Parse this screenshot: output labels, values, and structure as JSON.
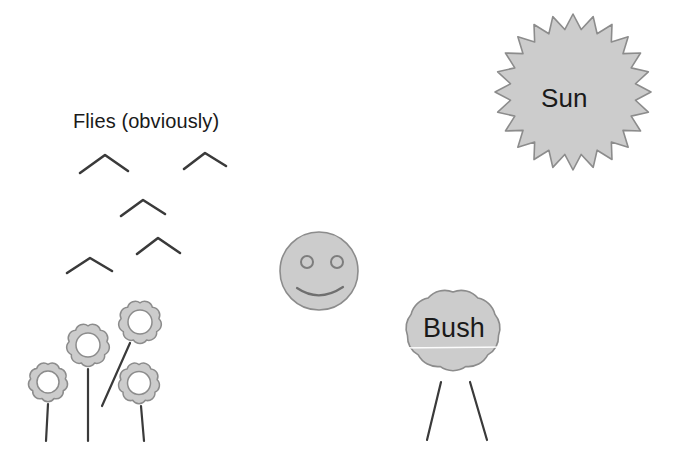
{
  "scene": {
    "title": "Hand-drawn outdoor scene",
    "width": 678,
    "height": 468,
    "background_color": "#ffffff",
    "fill_color": "#cccccc",
    "outline_color": "#808080",
    "ink_color": "#3a3a3a",
    "text_color": "#1a1a1a"
  },
  "labels": {
    "flies": "Flies (obviously)",
    "sun": "Sun",
    "bush": "Bush"
  },
  "objects": {
    "sun": {
      "name": "sun",
      "icon": "sun-starburst-icon",
      "shape": "starburst",
      "points": 24,
      "center": [
        573,
        92
      ],
      "outer_radius": 78,
      "inner_radius": 63,
      "fill": "#cccccc",
      "stroke": "#808080"
    },
    "face": {
      "name": "smiley-face",
      "icon": "smiley-face-icon",
      "shape": "circle",
      "center": [
        319,
        271
      ],
      "radius": 39,
      "fill": "#cccccc",
      "stroke": "#808080",
      "eyes": [
        {
          "center": [
            307,
            262
          ],
          "radius": 6
        },
        {
          "center": [
            337,
            262
          ],
          "radius": 6
        }
      ],
      "mouth": {
        "from": [
          297,
          288
        ],
        "control": [
          319,
          303
        ],
        "to": [
          343,
          287
        ]
      }
    },
    "bush": {
      "name": "bush",
      "icon": "bush-cloud-icon",
      "shape": "cloud",
      "center": [
        453,
        330
      ],
      "fill": "#cccccc",
      "stroke": "#808080",
      "lobes": 11,
      "stems": [
        {
          "from": [
            441,
            382
          ],
          "to": [
            427,
            440
          ]
        },
        {
          "from": [
            470,
            382
          ],
          "to": [
            487,
            440
          ]
        }
      ]
    },
    "flies": {
      "name": "flies",
      "icon": "chevron-fly-icon",
      "count": 5,
      "stroke": "#3a3a3a",
      "stroke_width": 2.6,
      "marks": [
        {
          "left": [
            80,
            173
          ],
          "apex": [
            105,
            155
          ],
          "right": [
            128,
            171
          ]
        },
        {
          "left": [
            184,
            169
          ],
          "apex": [
            205,
            153
          ],
          "right": [
            226,
            166
          ]
        },
        {
          "left": [
            121,
            216
          ],
          "apex": [
            143,
            200
          ],
          "right": [
            165,
            214
          ]
        },
        {
          "left": [
            137,
            254
          ],
          "apex": [
            158,
            238
          ],
          "right": [
            180,
            253
          ]
        },
        {
          "left": [
            67,
            273
          ],
          "apex": [
            90,
            258
          ],
          "right": [
            112,
            271
          ]
        }
      ]
    },
    "flowers": {
      "name": "flowers",
      "icon": "flower-icon",
      "count": 4,
      "fill": "#cccccc",
      "stroke": "#808080",
      "petals": 9,
      "items": [
        {
          "center": [
            48,
            382
          ],
          "outer_radius": 22,
          "inner_radius": 11,
          "stem": {
            "from": [
              48,
              404
            ],
            "to": [
              46,
              441
            ]
          }
        },
        {
          "center": [
            88,
            345
          ],
          "outer_radius": 24,
          "inner_radius": 12,
          "stem": {
            "from": [
              88,
              369
            ],
            "to": [
              88,
              441
            ]
          }
        },
        {
          "center": [
            140,
            322
          ],
          "outer_radius": 24,
          "inner_radius": 12,
          "stem": {
            "from": [
              130,
              343
            ],
            "to": [
              102,
              406
            ]
          }
        },
        {
          "center": [
            139,
            383
          ],
          "outer_radius": 23,
          "inner_radius": 11.5,
          "stem": {
            "from": [
              141,
              406
            ],
            "to": [
              144,
              441
            ]
          }
        }
      ]
    }
  }
}
